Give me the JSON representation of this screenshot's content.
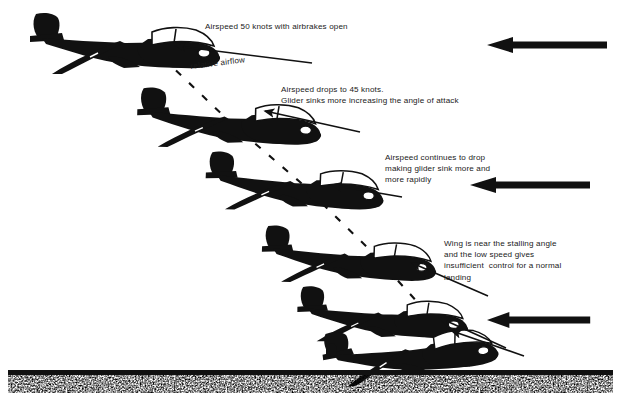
{
  "figure": {
    "background_color": "#ffffff",
    "ink_color": "#111111",
    "width": 621,
    "height": 418
  },
  "annotations": [
    {
      "id": "anno-1",
      "name": "annotation-airspeed-50",
      "lines": [
        "Airspeed 50 knots with airbrakes open"
      ],
      "x": 205,
      "y": 21
    },
    {
      "id": "anno-2",
      "name": "annotation-airspeed-45",
      "lines": [
        "Airspeed drops to 45 knots.",
        "Glider sinks more increasing the angle of attack"
      ],
      "x": 281,
      "y": 84
    },
    {
      "id": "anno-3",
      "name": "annotation-airspeed-continues-drop",
      "lines": [
        "Airspeed continues to drop",
        "making glider sink more and",
        "more rapidly"
      ],
      "x": 385,
      "y": 152
    },
    {
      "id": "anno-4",
      "name": "annotation-stalling-angle",
      "lines": [
        "Wing is near the stalling angle",
        "and the low speed gives",
        "insufficient  control for a normal",
        "landing"
      ],
      "x": 444,
      "y": 238
    }
  ],
  "airflow_label": {
    "name": "relative-airflow-label",
    "text": "relative airflow",
    "x": 190,
    "y": 62,
    "rotation_deg": -7
  },
  "gliders": [
    {
      "name": "glider-position-1",
      "x": 28,
      "y": 12,
      "scale": 1.0,
      "rotation_deg": 0,
      "label_ref": "anno-1"
    },
    {
      "name": "glider-position-2",
      "x": 136,
      "y": 86,
      "scale": 0.97,
      "rotation_deg": 1.5,
      "label_ref": "anno-2"
    },
    {
      "name": "glider-position-3",
      "x": 205,
      "y": 150,
      "scale": 0.94,
      "rotation_deg": 2.5,
      "label_ref": "anno-3"
    },
    {
      "name": "glider-position-4",
      "x": 261,
      "y": 224,
      "scale": 0.92,
      "rotation_deg": 2.0,
      "label_ref": "anno-4"
    },
    {
      "name": "glider-position-5",
      "x": 296,
      "y": 285,
      "scale": 0.9,
      "rotation_deg": 1.0,
      "label_ref": null
    },
    {
      "name": "glider-position-6-touchdown",
      "x": 318,
      "y": 333,
      "scale": 0.92,
      "rotation_deg": -7.0,
      "label_ref": null
    }
  ],
  "relative_airflow_arrows": [
    {
      "name": "airflow-arrow-top",
      "x": 487,
      "y": 45,
      "length": 118
    },
    {
      "name": "airflow-arrow-middle",
      "x": 470,
      "y": 185,
      "length": 118
    },
    {
      "name": "airflow-arrow-bottom",
      "x": 487,
      "y": 320,
      "length": 100
    }
  ],
  "pointer_arrows": [
    {
      "name": "pointer-arrow-1",
      "x1": 295,
      "y1": 105,
      "x2": 178,
      "y2": 47
    },
    {
      "name": "pointer-arrow-2",
      "x1": 360,
      "y1": 132,
      "x2": 263,
      "y2": 110
    },
    {
      "name": "pointer-arrow-3",
      "x1": 400,
      "y1": 196,
      "x2": 330,
      "y2": 184
    },
    {
      "name": "pointer-arrow-4",
      "x1": 482,
      "y1": 292,
      "x2": 412,
      "y2": 263
    },
    {
      "name": "pointer-arrow-5",
      "x1": 500,
      "y1": 345,
      "x2": 440,
      "y2": 318
    },
    {
      "name": "pointer-arrow-6",
      "x1": 522,
      "y1": 353,
      "x2": 451,
      "y2": 330
    }
  ],
  "flight_path": {
    "name": "flight-path-dashed-line",
    "style": "dashed",
    "points": [
      [
        163,
        58
      ],
      [
        230,
        122
      ],
      [
        300,
        182
      ],
      [
        370,
        250
      ],
      [
        420,
        305
      ],
      [
        455,
        345
      ],
      [
        470,
        366
      ]
    ]
  },
  "ground": {
    "name": "ground-surface",
    "line_y": 372,
    "line_thickness": 5,
    "texture_band_height": 18,
    "texture": "stipple"
  },
  "bird": {
    "name": "ground-marker-object",
    "x": 330,
    "y": 348
  }
}
